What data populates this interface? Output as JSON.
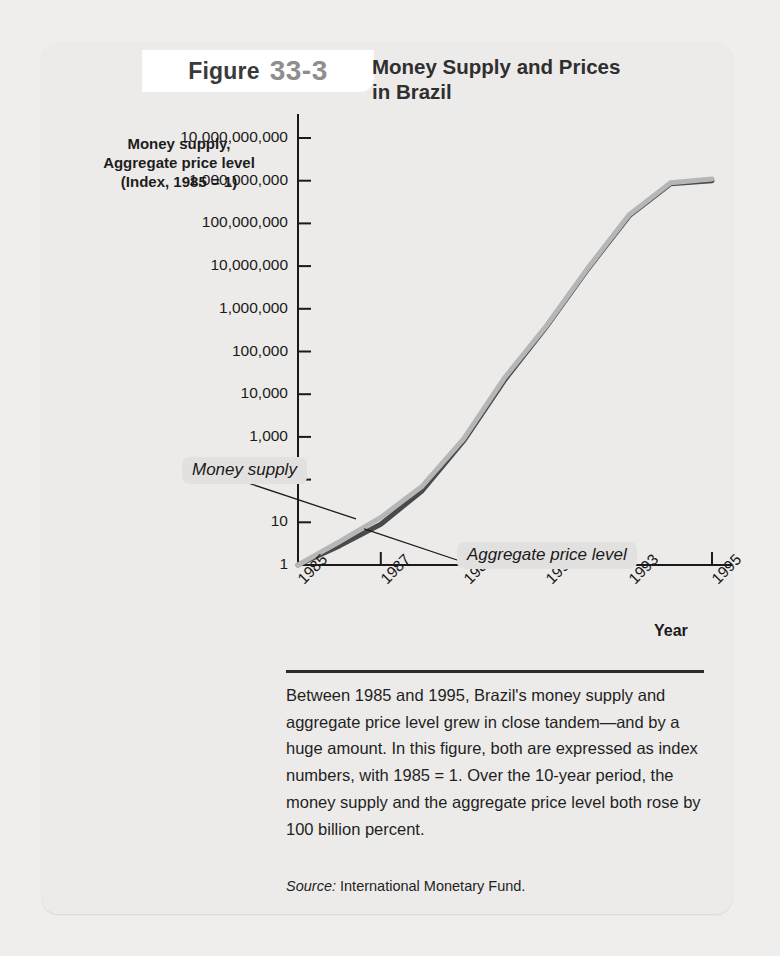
{
  "page": {
    "bleed_text": "",
    "background_color": "#f0eeec",
    "card_color": "#edebe9"
  },
  "header": {
    "figure_word": "Figure",
    "figure_number": "33-3",
    "title_line1": "Money Supply and Prices",
    "title_line2": "in Brazil"
  },
  "axis_title": {
    "line1": "Money supply,",
    "line2": "Aggregate price level",
    "line3": "(Index, 1985 = 1)"
  },
  "callouts": {
    "money_supply": "Money supply",
    "aggregate_price_level": "Aggregate price level"
  },
  "xaxis_name": "Year",
  "caption": {
    "text": "Between 1985 and 1995, Brazil's money supply and aggregate price level grew in close tandem—and by a huge amount. In this figure, both are expressed as index numbers, with 1985 = 1. Over the 10-year period, the money supply and the aggregate price level both rose by 100 billion percent.",
    "source_label": "Source:",
    "source_value": "International Monetary Fund."
  },
  "chart_data": {
    "type": "line",
    "title": "Money Supply and Prices in Brazil",
    "xlabel": "Year",
    "ylabel": "Money supply, Aggregate price level (Index, 1985 = 1)",
    "yscale": "log",
    "ylim": [
      1,
      10000000000
    ],
    "xlim": [
      1985,
      1995
    ],
    "grid": false,
    "legend": "inline-callouts",
    "ytick_labels": [
      "10,000,000,000",
      "1,000,000,000",
      "100,000,000",
      "10,000,000",
      "1,000,000",
      "100,000",
      "10,000",
      "1,000",
      "100",
      "10",
      "1"
    ],
    "ytick_values": [
      10000000000,
      1000000000,
      100000000,
      10000000,
      1000000,
      100000,
      10000,
      1000,
      100,
      10,
      1
    ],
    "xtick_labels": [
      "1985",
      "1987",
      "1989",
      "1991",
      "1993",
      "1995"
    ],
    "xtick_values": [
      1985,
      1987,
      1989,
      1991,
      1993,
      1995
    ],
    "x": [
      1985,
      1986,
      1987,
      1988,
      1989,
      1990,
      1991,
      1992,
      1993,
      1994,
      1995
    ],
    "series": [
      {
        "name": "Money supply",
        "color": "#b6b6b6",
        "values": [
          1,
          3.5,
          13,
          70,
          900,
          25000,
          400000,
          9000000,
          160000000,
          900000000,
          1100000000
        ]
      },
      {
        "name": "Aggregate price level",
        "color": "#4a4a4a",
        "values": [
          1,
          2.8,
          9,
          55,
          800,
          22000,
          380000,
          8500000,
          150000000,
          850000000,
          1000000000
        ]
      }
    ],
    "annotations": [
      {
        "label": "Money supply",
        "points_to_x": 1986.4,
        "points_to_y": 12
      },
      {
        "label": "Aggregate price level",
        "points_to_x": 1986.6,
        "points_to_y": 7
      }
    ]
  }
}
